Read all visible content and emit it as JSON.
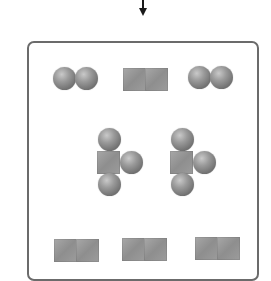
{
  "diagram": {
    "type": "particle-model",
    "arrow": {
      "direction": "down",
      "color": "#1a1a1a"
    },
    "container": {
      "border_color": "#6b6b6b",
      "background": "#ffffff"
    },
    "colors": {
      "sphere": "#8a8a8a",
      "cube": "#999999"
    },
    "particles": [
      {
        "kind": "diatomic-sphere",
        "count": 2,
        "row": "top",
        "label": ""
      },
      {
        "kind": "diatomic-cube",
        "count": 1,
        "row": "top",
        "label": ""
      },
      {
        "kind": "cube-with-three-spheres",
        "count": 2,
        "row": "middle",
        "label": ""
      },
      {
        "kind": "diatomic-cube",
        "count": 3,
        "row": "bottom",
        "label": ""
      }
    ]
  }
}
